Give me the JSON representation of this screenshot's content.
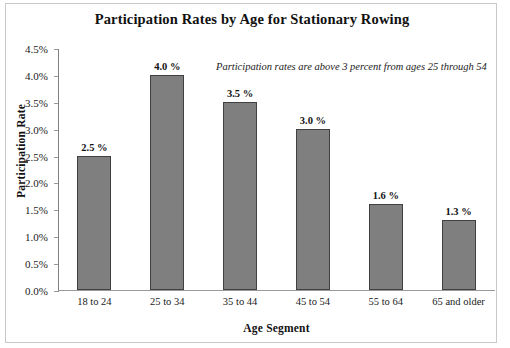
{
  "chart_data": {
    "type": "bar",
    "title": "Participation Rates by Age for Stationary Rowing",
    "xlabel": "Age Segment",
    "ylabel": "Participation Rate",
    "categories": [
      "18 to 24",
      "25 to 34",
      "35 to 44",
      "45 to 54",
      "55 to 64",
      "65 and older"
    ],
    "values": [
      2.5,
      4.0,
      3.5,
      3.0,
      1.6,
      1.3
    ],
    "value_labels": [
      "2.5 %",
      "4.0 %",
      "3.5 %",
      "3.0 %",
      "1.6 %",
      "1.3 %"
    ],
    "ylim": [
      0,
      4.5
    ],
    "ytick_labels": [
      "0.0%",
      "0.5%",
      "1.0%",
      "1.5%",
      "2.0%",
      "2.5%",
      "3.0%",
      "3.5%",
      "4.0%",
      "4.5%"
    ],
    "ytick_values": [
      0,
      0.5,
      1.0,
      1.5,
      2.0,
      2.5,
      3.0,
      3.5,
      4.0,
      4.5
    ],
    "grid": false,
    "legend": false,
    "annotation": "Participation rates are above 3 percent from ages 25 through 54",
    "bar_color": "#7f7f7f",
    "bar_edge_color": "#404040",
    "background_color": "#ffffff"
  }
}
